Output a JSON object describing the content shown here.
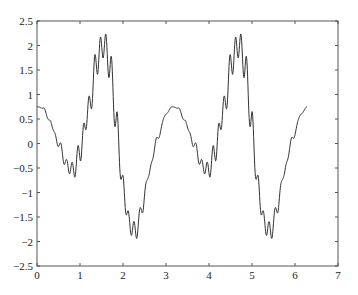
{
  "chart_data": {
    "type": "line",
    "title": "",
    "xlabel": "",
    "ylabel": "",
    "xlim": [
      0,
      7
    ],
    "ylim": [
      -2.5,
      2.5
    ],
    "grid": false,
    "legend": null,
    "x_ticks": [
      "0",
      "1",
      "2",
      "3",
      "4",
      "5",
      "6",
      "7"
    ],
    "y_ticks": [
      "2.5",
      "2",
      "1.5",
      "1",
      "0.5",
      "0",
      "-0.5",
      "-1",
      "-1.5",
      "-2",
      "-2.5"
    ],
    "series": [
      {
        "name": "signal",
        "color": "#333333",
        "x_range": [
          0,
          6.28
        ],
        "base_points": [
          [
            0.0,
            0.75
          ],
          [
            0.15,
            0.72
          ],
          [
            0.3,
            0.45
          ],
          [
            0.5,
            0.0
          ],
          [
            0.7,
            -0.45
          ],
          [
            0.85,
            -0.55
          ],
          [
            1.0,
            -0.15
          ],
          [
            1.2,
            0.7
          ],
          [
            1.4,
            1.7
          ],
          [
            1.55,
            2.05
          ],
          [
            1.7,
            1.6
          ],
          [
            1.85,
            0.4
          ],
          [
            2.0,
            -0.9
          ],
          [
            2.15,
            -1.65
          ],
          [
            2.3,
            -1.8
          ],
          [
            2.45,
            -1.3
          ],
          [
            2.6,
            -0.6
          ],
          [
            2.8,
            0.1
          ],
          [
            3.0,
            0.6
          ],
          [
            3.14,
            0.75
          ]
        ],
        "ripple_amplitude": 0.3,
        "ripple_frequency": 48,
        "period": 3.1416,
        "notable_values": {
          "start": 0.75,
          "max": 2.4,
          "max_x": [
            1.5,
            4.65
          ],
          "min": -2.05,
          "min_x": [
            2.25,
            5.4
          ],
          "smooth_peak_x": 3.14,
          "smooth_peak_y": 0.75,
          "end": 0.75
        }
      }
    ]
  }
}
